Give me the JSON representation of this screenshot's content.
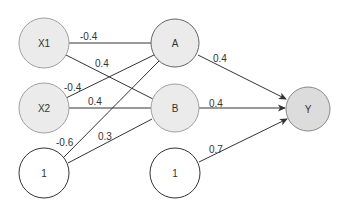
{
  "diagram": {
    "type": "neural-network",
    "colors": {
      "input_fill": "#ebebeb",
      "hidden_fill": "#ebebeb",
      "bias_fill": "#ffffff",
      "output_fill": "#dcdcdc",
      "stroke_light": "#9a9a9a",
      "stroke_dark": "#333333",
      "edge": "#333333"
    },
    "nodes": [
      {
        "id": "x1",
        "label": "X1",
        "cx": 44,
        "cy": 43,
        "r": 25,
        "fill": "#ebebeb",
        "stroke": "#a0a0a0"
      },
      {
        "id": "x2",
        "label": "X2",
        "cx": 44,
        "cy": 108,
        "r": 25,
        "fill": "#ebebeb",
        "stroke": "#a0a0a0"
      },
      {
        "id": "bias1",
        "label": "1",
        "cx": 44,
        "cy": 173,
        "r": 25,
        "fill": "#ffffff",
        "stroke": "#333333"
      },
      {
        "id": "a",
        "label": "A",
        "cx": 175,
        "cy": 43,
        "r": 24,
        "fill": "#ebebeb",
        "stroke": "#666666"
      },
      {
        "id": "b",
        "label": "B",
        "cx": 175,
        "cy": 108,
        "r": 24,
        "fill": "#ebebeb",
        "stroke": "#a0a0a0"
      },
      {
        "id": "bias2",
        "label": "1",
        "cx": 175,
        "cy": 173,
        "r": 25,
        "fill": "#ffffff",
        "stroke": "#333333"
      },
      {
        "id": "y",
        "label": "Y",
        "cx": 308,
        "cy": 109,
        "r": 22,
        "fill": "#dcdcdc",
        "stroke": "#888888"
      }
    ],
    "edges": [
      {
        "from": "x1",
        "to": "a",
        "weight": "-0.4",
        "x1": 69,
        "y1": 43,
        "x2": 151,
        "y2": 43,
        "lx": 80,
        "ly": 40,
        "arrow": false
      },
      {
        "from": "x1",
        "to": "b",
        "weight": "0.4",
        "x1": 66,
        "y1": 55,
        "x2": 153,
        "y2": 99,
        "lx": 95,
        "ly": 67,
        "arrow": false
      },
      {
        "from": "x2",
        "to": "a",
        "weight": "-0.4",
        "x1": 66,
        "y1": 98,
        "x2": 154,
        "y2": 55,
        "lx": 64,
        "ly": 91,
        "arrow": false
      },
      {
        "from": "x2",
        "to": "b",
        "weight": "0.4",
        "x1": 69,
        "y1": 108,
        "x2": 151,
        "y2": 108,
        "lx": 88,
        "ly": 105,
        "arrow": false
      },
      {
        "from": "bias1",
        "to": "a",
        "weight": "-0.6",
        "x1": 64,
        "y1": 157,
        "x2": 159,
        "y2": 61,
        "lx": 56,
        "ly": 146,
        "arrow": false
      },
      {
        "from": "bias1",
        "to": "b",
        "weight": "0.3",
        "x1": 68,
        "y1": 163,
        "x2": 152,
        "y2": 119,
        "lx": 98,
        "ly": 140,
        "arrow": false
      },
      {
        "from": "a",
        "to": "y",
        "weight": "0.4",
        "x1": 198,
        "y1": 55,
        "x2": 286,
        "y2": 99,
        "lx": 213,
        "ly": 62,
        "arrow": true
      },
      {
        "from": "b",
        "to": "y",
        "weight": "0.4",
        "x1": 199,
        "y1": 108,
        "x2": 285,
        "y2": 108,
        "lx": 209,
        "ly": 107,
        "arrow": true
      },
      {
        "from": "bias2",
        "to": "y",
        "weight": "0.7",
        "x1": 199,
        "y1": 162,
        "x2": 287,
        "y2": 119,
        "lx": 209,
        "ly": 153,
        "arrow": true
      }
    ]
  }
}
